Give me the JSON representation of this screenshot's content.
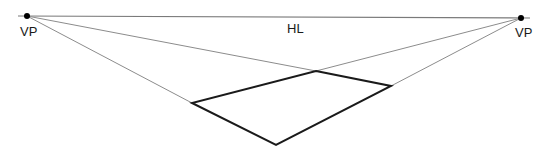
{
  "diagram": {
    "labels": {
      "vp_left": "VP",
      "vp_right": "VP",
      "horizon": "HL"
    },
    "colors": {
      "background": "#ffffff",
      "horizon_line": "#7a7a7a",
      "construction_lines": "#8c8c8c",
      "shape_outline": "#1a1a1a",
      "vanishing_point": "#000000"
    },
    "horizon_line": {
      "x1": 18,
      "y1": 16,
      "x2": 530,
      "y2": 18
    },
    "vanishing_points": [
      {
        "name": "left",
        "x": 27,
        "y": 16
      },
      {
        "name": "right",
        "x": 521,
        "y": 18
      }
    ],
    "shape": {
      "kind": "square-in-perspective",
      "corners": {
        "far": {
          "x": 316,
          "y": 71
        },
        "left": {
          "x": 192,
          "y": 103
        },
        "right": {
          "x": 391,
          "y": 86
        },
        "near": {
          "x": 276,
          "y": 145
        }
      }
    }
  }
}
